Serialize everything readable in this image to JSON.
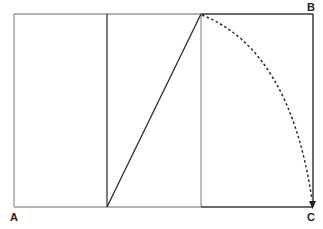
{
  "diagram": {
    "type": "golden-rectangle-construction",
    "labels": {
      "a": "A",
      "b": "B",
      "c": "C"
    },
    "colors": {
      "light_line": "#9a9a9a",
      "dark_line": "#3a3a3a",
      "background": "#ffffff"
    },
    "geometry": {
      "rect": {
        "x1": 14,
        "y1": 14,
        "x2": 313,
        "y2": 207
      },
      "dividers_x": [
        107,
        201
      ],
      "diagonal": {
        "from": [
          107,
          207
        ],
        "to": [
          201,
          14
        ]
      },
      "arc": {
        "from": [
          201,
          14
        ],
        "to": [
          313,
          207
        ],
        "center": [
          107,
          207
        ],
        "style": "dashed",
        "arrowhead": "down"
      }
    }
  }
}
